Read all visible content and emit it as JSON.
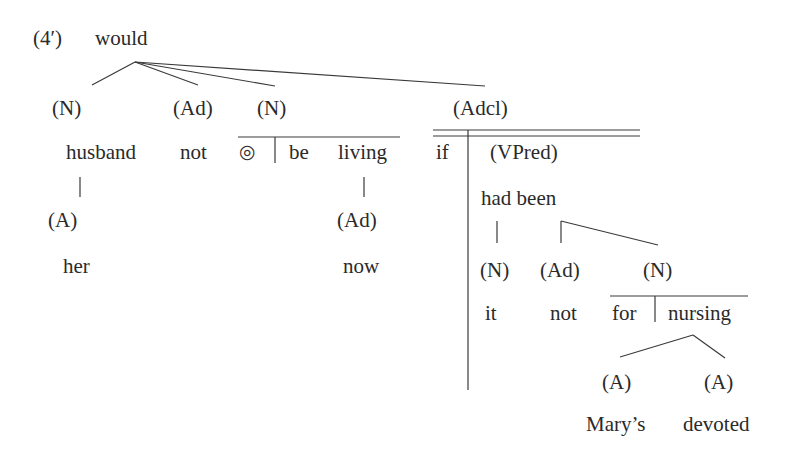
{
  "example_number": "(4′)",
  "root": "would",
  "line_color": "#3a3a3a",
  "nodes": [
    {
      "id": "n1",
      "text": "(N)",
      "x": 52,
      "y": 98
    },
    {
      "id": "ad1",
      "text": "(Ad)",
      "x": 173,
      "y": 98
    },
    {
      "id": "n2",
      "text": "(N)",
      "x": 257,
      "y": 98
    },
    {
      "id": "adcl",
      "text": "(Adcl)",
      "x": 453,
      "y": 98
    },
    {
      "id": "husband",
      "text": "husband",
      "x": 66,
      "y": 142
    },
    {
      "id": "not1",
      "text": "not",
      "x": 180,
      "y": 142
    },
    {
      "id": "circle",
      "text": "◎",
      "x": 239,
      "y": 142
    },
    {
      "id": "be",
      "text": "be",
      "x": 289,
      "y": 142
    },
    {
      "id": "living",
      "text": "living",
      "x": 338,
      "y": 142
    },
    {
      "id": "if",
      "text": "if",
      "x": 436,
      "y": 142
    },
    {
      "id": "vpred",
      "text": "(VPred)",
      "x": 490,
      "y": 142
    },
    {
      "id": "a1",
      "text": "(A)",
      "x": 48,
      "y": 210
    },
    {
      "id": "ad2",
      "text": "(Ad)",
      "x": 337,
      "y": 210
    },
    {
      "id": "hadbeen",
      "text": "had been",
      "x": 481,
      "y": 188
    },
    {
      "id": "her",
      "text": "her",
      "x": 63,
      "y": 256
    },
    {
      "id": "now",
      "text": "now",
      "x": 343,
      "y": 256
    },
    {
      "id": "n3",
      "text": "(N)",
      "x": 480,
      "y": 260
    },
    {
      "id": "ad3",
      "text": "(Ad)",
      "x": 540,
      "y": 260
    },
    {
      "id": "n4",
      "text": "(N)",
      "x": 643,
      "y": 260
    },
    {
      "id": "it",
      "text": "it",
      "x": 485,
      "y": 303
    },
    {
      "id": "not2",
      "text": "not",
      "x": 550,
      "y": 303
    },
    {
      "id": "for",
      "text": "for",
      "x": 612,
      "y": 303
    },
    {
      "id": "nursing",
      "text": "nursing",
      "x": 668,
      "y": 303
    },
    {
      "id": "a2",
      "text": "(A)",
      "x": 602,
      "y": 372
    },
    {
      "id": "a3",
      "text": "(A)",
      "x": 704,
      "y": 372
    },
    {
      "id": "marys",
      "text": "Mary’s",
      "x": 586,
      "y": 414
    },
    {
      "id": "devoted",
      "text": "devoted",
      "x": 683,
      "y": 414
    }
  ]
}
